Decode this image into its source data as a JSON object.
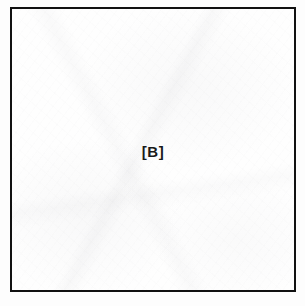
{
  "figure": {
    "panel_label": "[B]",
    "frame_color": "#111111",
    "panel_background": "#fefefe",
    "label_color": "#1a1a1a",
    "page_background": "#ffffff"
  }
}
